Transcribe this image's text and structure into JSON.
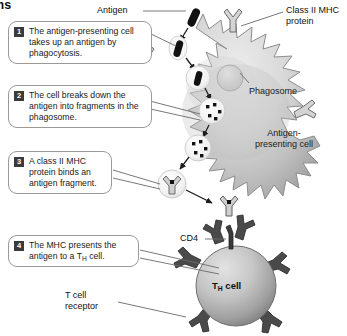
{
  "figure": {
    "heading_fragment": "ms"
  },
  "steps": [
    {
      "number": "1",
      "text": "The antigen-presenting cell takes up an antigen by phagocytosis."
    },
    {
      "number": "2",
      "text": "The cell breaks down the antigen into fragments in the phagosome."
    },
    {
      "number": "3",
      "text": "A class II MHC protein binds an antigen fragment."
    },
    {
      "number": "4",
      "text_before": "The MHC presents the antigen to a T",
      "subscript": "H",
      "text_after": " cell."
    }
  ],
  "labels": {
    "antigen": "Antigen",
    "class_ii_mhc_line1": "Class II MHC",
    "class_ii_mhc_line2": "protein",
    "phagosome": "Phagosome",
    "apc_line1": "Antigen-",
    "apc_line2": "presenting cell",
    "cd4": "CD4",
    "t_cell_receptor_line1": "T cell",
    "t_cell_receptor_line2": "receptor",
    "th_cell_before": "T",
    "th_cell_sub": "H",
    "th_cell_after": " cell"
  },
  "icons": {
    "antigen": "bacillus-rod-icon",
    "mhc": "y-shaped-receptor-icon",
    "tcr": "t-cell-receptor-icon",
    "fragment": "antigen-fragment-square-icon",
    "vesicle": "phagosome-vesicle-icon"
  },
  "colors": {
    "background": "#ffffff",
    "apc_fill_light": "#e2e2e2",
    "apc_fill_mid": "#c7c7c7",
    "apc_fill_dark": "#9a9a9a",
    "apc_outline": "#8d8d8d",
    "tcell_fill_light": "#d8d8d8",
    "tcell_fill_dark": "#8e8e8e",
    "tcell_outline": "#6f6f6f",
    "receptor_dark": "#4a4a4a",
    "mhc_gray": "#cfcfcf",
    "mhc_outline": "#6b6b6b",
    "antigen_black": "#111111",
    "callout_border": "#9a9a9a",
    "badge_fill": "#3b3b3b",
    "leader_line": "#6a6a6a",
    "arrow": "#1d1d1d",
    "text": "#1a1a1a"
  }
}
